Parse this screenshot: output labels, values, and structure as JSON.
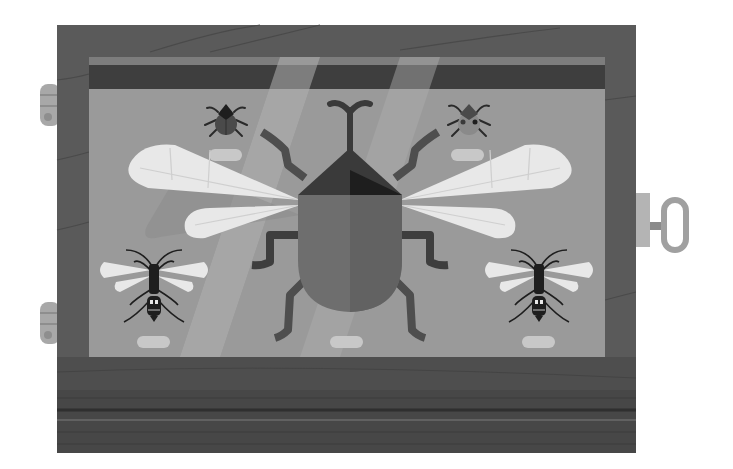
{
  "scene": {
    "title": "Insect specimen display case illustration",
    "style": "flat vector illustration, grayscale",
    "colors": {
      "background": "#ffffff",
      "frame_wood": "#5a5a5a",
      "frame_wood_bottom": "#4a4a4a",
      "panel": "#9a9a9a",
      "panel_header_dark": "#3e3e3e",
      "panel_header_light": "#7d7d7d",
      "light_beam": "#b0b0b0",
      "wing": "#e8e8e8",
      "wing_shadow": "#8a8a8a",
      "beetle_body": "#6e6e6e",
      "beetle_head": "#3a3a3a",
      "insect_dark": "#1e1e1e",
      "label_plate": "#c8c8c8",
      "hinge": "#a8a8a8",
      "key": "#a0a0a0"
    },
    "specimens": [
      {
        "name": "large-winged-beetle",
        "position": "center"
      },
      {
        "name": "small-beetle",
        "position": "top-left"
      },
      {
        "name": "small-bug",
        "position": "top-right"
      },
      {
        "name": "wasp",
        "position": "bottom-left"
      },
      {
        "name": "wasp",
        "position": "bottom-right"
      }
    ],
    "labels_count": 5,
    "hardware": [
      "hinge-top",
      "hinge-bottom",
      "key"
    ]
  }
}
